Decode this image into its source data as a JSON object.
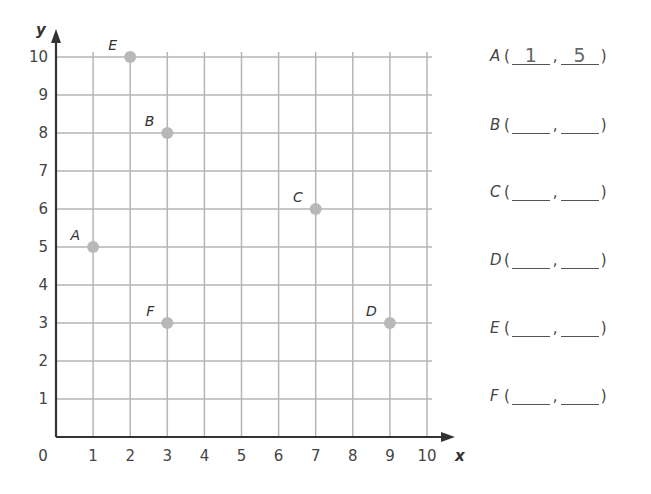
{
  "chart_data": {
    "type": "scatter",
    "title": "",
    "xlabel": "x",
    "ylabel": "y",
    "xlim": [
      0,
      10
    ],
    "ylim": [
      0,
      10
    ],
    "grid": true,
    "x_ticks": [
      "0",
      "1",
      "2",
      "3",
      "4",
      "5",
      "6",
      "7",
      "8",
      "9",
      "10"
    ],
    "y_ticks": [
      "1",
      "2",
      "3",
      "4",
      "5",
      "6",
      "7",
      "8",
      "9",
      "10"
    ],
    "points": [
      {
        "label": "A",
        "x": 1,
        "y": 5
      },
      {
        "label": "B",
        "x": 3,
        "y": 8
      },
      {
        "label": "C",
        "x": 7,
        "y": 6
      },
      {
        "label": "D",
        "x": 9,
        "y": 3
      },
      {
        "label": "E",
        "x": 2,
        "y": 10
      },
      {
        "label": "F",
        "x": 3,
        "y": 3
      }
    ],
    "point_color": "#b8b8b8",
    "grid_color": "#b5b5b5",
    "axis_color": "#333333"
  },
  "answers": [
    {
      "letter": "A",
      "open": "(",
      "x": "1",
      "comma": ",",
      "y": "5",
      "close": ")"
    },
    {
      "letter": "B",
      "open": "(",
      "x": "",
      "comma": ",",
      "y": "",
      "close": ")"
    },
    {
      "letter": "C",
      "open": "(",
      "x": "",
      "comma": ",",
      "y": "",
      "close": ")"
    },
    {
      "letter": "D",
      "open": "(",
      "x": "",
      "comma": ",",
      "y": "",
      "close": ")"
    },
    {
      "letter": "E",
      "open": "(",
      "x": "",
      "comma": ",",
      "y": "",
      "close": ")"
    },
    {
      "letter": "F",
      "open": "(",
      "x": "",
      "comma": ",",
      "y": "",
      "close": ")"
    }
  ]
}
